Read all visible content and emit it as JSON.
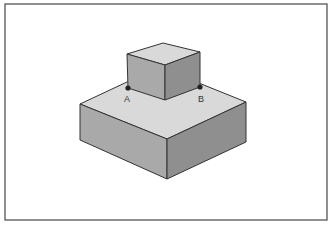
{
  "diagram": {
    "frame": {
      "x1": 5,
      "y1": 4,
      "x2": 327,
      "y2": 220,
      "stroke": "#555555"
    },
    "colors": {
      "top_face": "#d9d9d9",
      "left_face": "#a9a9a9",
      "right_face": "#8f8f8f",
      "edge": "#333333",
      "point": "#222222"
    },
    "large_box": {
      "top_left": [
        80,
        104
      ],
      "top_front": [
        167,
        139
      ],
      "top_right": [
        246,
        102
      ],
      "top_back": [
        159,
        67
      ],
      "bottom_left": [
        80,
        140
      ],
      "bottom_front": [
        167,
        179
      ],
      "bottom_right": [
        246,
        142
      ]
    },
    "small_cube": {
      "top_back": [
        163,
        43
      ],
      "top_left": [
        127,
        54
      ],
      "top_front": [
        165,
        65
      ],
      "top_right": [
        200,
        52
      ],
      "bottom_left": [
        128,
        88
      ],
      "bottom_front": [
        165,
        100
      ],
      "bottom_right": [
        200,
        87
      ]
    },
    "points": [
      {
        "name": "A",
        "label": "A",
        "x": 128,
        "y": 88,
        "label_x": 127,
        "label_y": 95
      },
      {
        "name": "B",
        "label": "B",
        "x": 200,
        "y": 87,
        "label_x": 201,
        "label_y": 95
      }
    ]
  }
}
